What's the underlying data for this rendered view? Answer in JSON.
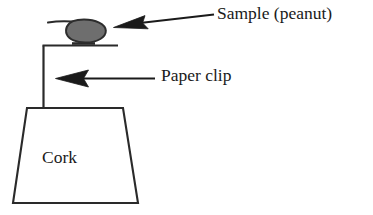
{
  "diagram": {
    "background_color": "#ffffff",
    "stroke_color": "#1a1a1a",
    "sample_fill_color": "#6e6e6e",
    "labels": {
      "sample": "Sample (peanut)",
      "paper_clip": "Paper clip",
      "cork": "Cork"
    },
    "parts": [
      {
        "name": "sample-peanut",
        "shape": "filled-oval",
        "fill": "#6e6e6e",
        "outline": "#1a1a1a"
      },
      {
        "name": "paper-clip-wire",
        "shape": "bent-wire",
        "outline": "#1a1a1a"
      },
      {
        "name": "cork-stopper",
        "shape": "trapezoid",
        "fill": "#ffffff",
        "outline": "#1a1a1a"
      }
    ],
    "annotations": [
      {
        "name": "sample-arrow",
        "points_to": "sample-peanut",
        "direction": "left"
      },
      {
        "name": "paper-clip-arrow",
        "points_to": "paper-clip-wire",
        "direction": "left"
      }
    ]
  }
}
